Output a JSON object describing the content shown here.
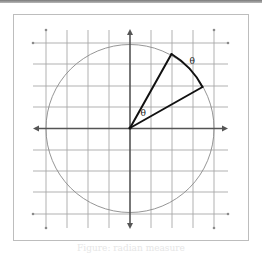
{
  "diagram": {
    "type": "unit-circle-angle",
    "angle_label_center": "θ",
    "arc_label": "θ",
    "colors": {
      "grid": "#a8a8a8",
      "axes": "#555555",
      "circle": "#8a8a8a",
      "rays": "#111111",
      "frame": "#bdbdbd"
    },
    "grid": {
      "lines_per_side": 4
    },
    "caption": "Figure: radian measure"
  }
}
